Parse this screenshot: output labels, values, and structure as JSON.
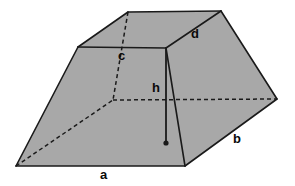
{
  "figure": {
    "type": "3d-geometry-diagram",
    "background_color": "#ffffff",
    "face_fill_color": "#a8a8a8",
    "edge_color": "#1a1a1a",
    "label_color": "#0a0a0a",
    "canvas": {
      "width": 295,
      "height": 186
    }
  },
  "labels": {
    "a": {
      "text": "a",
      "x": 100,
      "y": 168,
      "meaning": "bottom front base edge length"
    },
    "b": {
      "text": "b",
      "x": 233,
      "y": 132,
      "meaning": "lower right slant base edge length"
    },
    "c": {
      "text": "c",
      "x": 118,
      "y": 49,
      "meaning": "top front edge length"
    },
    "d": {
      "text": "d",
      "x": 191,
      "y": 27,
      "meaning": "upper right slant top edge length"
    },
    "h": {
      "text": "h",
      "x": 152,
      "y": 81,
      "meaning": "vertical height of the solid"
    }
  },
  "geometry": {
    "vertices": {
      "top_front_left": [
        78,
        47
      ],
      "top_back": [
        128,
        12
      ],
      "top_right_apex": [
        221,
        11
      ],
      "top_front_right": [
        166,
        48
      ],
      "base_front_left": [
        16,
        166
      ],
      "base_front_right": [
        185,
        166
      ],
      "base_right": [
        277,
        99
      ],
      "hidden_back_left": [
        113,
        100
      ]
    },
    "solid_edges": [
      {
        "name": "top-front-edge",
        "from": [
          78,
          47
        ],
        "to": [
          166,
          48
        ]
      },
      {
        "name": "top-left-ridge",
        "from": [
          78,
          47
        ],
        "to": [
          128,
          12
        ]
      },
      {
        "name": "top-back-edge",
        "from": [
          128,
          12
        ],
        "to": [
          221,
          11
        ]
      },
      {
        "name": "top-right-ridge-d",
        "from": [
          221,
          11
        ],
        "to": [
          166,
          48
        ]
      },
      {
        "name": "front-left-slant",
        "from": [
          78,
          47
        ],
        "to": [
          16,
          166
        ]
      },
      {
        "name": "base-front-edge-a",
        "from": [
          16,
          166
        ],
        "to": [
          185,
          166
        ]
      },
      {
        "name": "front-right-slant",
        "from": [
          166,
          48
        ],
        "to": [
          185,
          166
        ]
      },
      {
        "name": "base-right-slant-b",
        "from": [
          185,
          166
        ],
        "to": [
          277,
          99
        ]
      },
      {
        "name": "right-upper-slant",
        "from": [
          277,
          99
        ],
        "to": [
          221,
          11
        ]
      }
    ],
    "hidden_edges": [
      {
        "name": "hidden-back-vertical",
        "from": [
          128,
          12
        ],
        "to": [
          113,
          100
        ]
      },
      {
        "name": "hidden-back-horizontal",
        "from": [
          113,
          100
        ],
        "to": [
          277,
          99
        ]
      },
      {
        "name": "hidden-base-diagonal",
        "from": [
          16,
          166
        ],
        "to": [
          113,
          100
        ]
      }
    ],
    "height_line": {
      "from": [
        166,
        48
      ],
      "to": [
        166,
        143
      ],
      "endpoint_dot": [
        166,
        143
      ]
    }
  }
}
